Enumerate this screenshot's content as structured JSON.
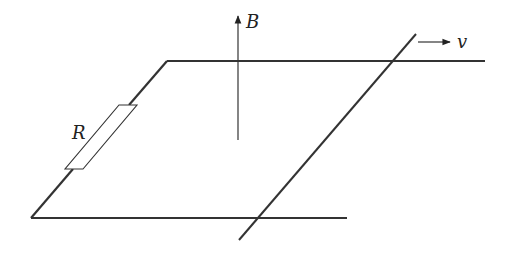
{
  "diagram": {
    "labels": {
      "magnetic_field": "B",
      "velocity": "v",
      "resistor": "R"
    },
    "colors": {
      "line": "#333333",
      "background": "#ffffff"
    },
    "elements": [
      {
        "name": "top-rail",
        "type": "line"
      },
      {
        "name": "bottom-rail",
        "type": "line"
      },
      {
        "name": "left-connector-with-resistor",
        "type": "line"
      },
      {
        "name": "sliding-rod",
        "type": "line"
      },
      {
        "name": "magnetic-field-arrow",
        "direction": "up"
      },
      {
        "name": "velocity-arrow",
        "direction": "right"
      }
    ]
  }
}
